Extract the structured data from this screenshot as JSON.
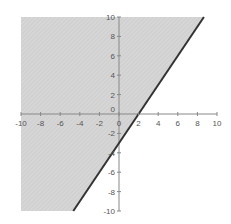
{
  "chart_data": {
    "type": "area",
    "title": "",
    "xlabel": "",
    "ylabel": "",
    "xlim": [
      -10,
      10
    ],
    "ylim": [
      -10,
      10
    ],
    "grid": false,
    "legend": null,
    "boundary_line": {
      "equation": "y = 1.5x - 3",
      "slope": 1.5,
      "intercept": -3,
      "style": "solid",
      "color": "#333333"
    },
    "shaded_region": {
      "inequality": "y >= 1.5x - 3",
      "side": "above-left",
      "fill": "#d4d4d4"
    },
    "x_ticks": [
      -10,
      -8,
      -6,
      -4,
      -2,
      0,
      2,
      4,
      6,
      8,
      10
    ],
    "y_ticks": [
      10,
      8,
      6,
      4,
      2,
      0,
      -2,
      -4,
      -6,
      -8,
      -10
    ],
    "x_tick_labels": [
      "-10",
      "-8",
      "-6",
      "-4",
      "-2",
      "0",
      "2",
      "4",
      "6",
      "8",
      "10"
    ],
    "y_tick_labels": [
      "10",
      "8",
      "6",
      "4",
      "2",
      "0",
      "-2",
      "-4",
      "-6",
      "-8",
      "-10"
    ]
  }
}
